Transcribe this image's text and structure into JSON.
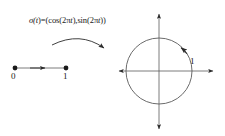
{
  "figure": {
    "background_color": "#ffffff",
    "stroke_color": "#2b2b2b",
    "text_color": "#1a1a1a",
    "formula": {
      "full_text": "σ(t)=(cos(2πt),sin(2πt))",
      "lhs": "σ(",
      "lhs_var": "t",
      "mid": ")=(cos(2π",
      "var2": "t",
      "mid2": "),sin(2π",
      "var3": "t",
      "tail": "))"
    },
    "interval": {
      "name": "unit-interval",
      "start_label": "0",
      "end_label": "1",
      "start_point": [
        15,
        68
      ],
      "end_point": [
        66,
        68
      ],
      "direction": "right",
      "arrow_at": [
        41,
        68
      ]
    },
    "map_arrow": {
      "name": "curved-map-arrow",
      "from": [
        52,
        44
      ],
      "to": [
        106,
        49
      ],
      "control": [
        79,
        32
      ],
      "direction": "right"
    },
    "axes": {
      "center": [
        159,
        71
      ],
      "x_min": 117,
      "x_max": 215,
      "y_min": 12,
      "y_max": 131,
      "arrowheads": [
        "left",
        "right",
        "up",
        "down"
      ]
    },
    "circle": {
      "name": "unit-circle",
      "center": [
        159,
        71
      ],
      "radius": 33,
      "orientation": "counterclockwise",
      "arrow_angle_deg": 42,
      "radius_label": "1"
    }
  }
}
